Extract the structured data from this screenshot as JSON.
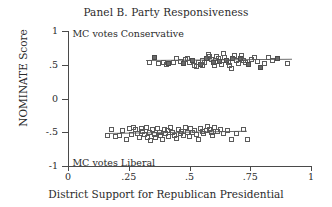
{
  "chart_data": {
    "type": "scatter",
    "title": "Panel B. Party Responsiveness",
    "xlabel": "District Support for Republican Presidential",
    "ylabel": "NOMINATE Score",
    "xlim": [
      0,
      1
    ],
    "ylim": [
      -1,
      1
    ],
    "grid": false,
    "legend": "none",
    "xticks": [
      0,
      0.25,
      0.5,
      0.75,
      1
    ],
    "xtick_labels": [
      "0",
      ".25",
      ".5",
      ".75",
      "1"
    ],
    "yticks": [
      -1,
      -0.5,
      0,
      0.5,
      1
    ],
    "ytick_labels": [
      "-1",
      "-.5",
      "0",
      ".5",
      "1"
    ],
    "annotations": [
      {
        "text": "MC votes Conservative",
        "x": 0.01,
        "y": 0.95,
        "name": "conservative-annotation"
      },
      {
        "text": "MC votes Liberal",
        "x": 0.01,
        "y": -0.95,
        "name": "liberal-annotation"
      }
    ],
    "series": [
      {
        "name": "Republican members",
        "marker": "open-square",
        "fit_line": {
          "x_start": 0.32,
          "x_end": 0.92,
          "y_start": 0.565,
          "y_end": 0.585
        },
        "points": [
          {
            "x": 0.33,
            "y": 0.545
          },
          {
            "x": 0.352,
            "y": 0.618
          },
          {
            "x": 0.368,
            "y": 0.53
          },
          {
            "x": 0.388,
            "y": 0.545
          },
          {
            "x": 0.4,
            "y": 0.52
          },
          {
            "x": 0.412,
            "y": 0.538
          },
          {
            "x": 0.43,
            "y": 0.548
          },
          {
            "x": 0.445,
            "y": 0.6
          },
          {
            "x": 0.458,
            "y": 0.56
          },
          {
            "x": 0.47,
            "y": 0.535
          },
          {
            "x": 0.478,
            "y": 0.592
          },
          {
            "x": 0.49,
            "y": 0.61
          },
          {
            "x": 0.498,
            "y": 0.548
          },
          {
            "x": 0.51,
            "y": 0.57
          },
          {
            "x": 0.518,
            "y": 0.502
          },
          {
            "x": 0.525,
            "y": 0.488
          },
          {
            "x": 0.532,
            "y": 0.54
          },
          {
            "x": 0.54,
            "y": 0.52
          },
          {
            "x": 0.548,
            "y": 0.575
          },
          {
            "x": 0.552,
            "y": 0.498
          },
          {
            "x": 0.56,
            "y": 0.545
          },
          {
            "x": 0.568,
            "y": 0.612
          },
          {
            "x": 0.575,
            "y": 0.66
          },
          {
            "x": 0.58,
            "y": 0.63
          },
          {
            "x": 0.588,
            "y": 0.585
          },
          {
            "x": 0.595,
            "y": 0.552
          },
          {
            "x": 0.6,
            "y": 0.508
          },
          {
            "x": 0.608,
            "y": 0.64
          },
          {
            "x": 0.615,
            "y": 0.6
          },
          {
            "x": 0.62,
            "y": 0.558
          },
          {
            "x": 0.628,
            "y": 0.522
          },
          {
            "x": 0.635,
            "y": 0.672
          },
          {
            "x": 0.64,
            "y": 0.618
          },
          {
            "x": 0.648,
            "y": 0.58
          },
          {
            "x": 0.655,
            "y": 0.548
          },
          {
            "x": 0.66,
            "y": 0.505
          },
          {
            "x": 0.668,
            "y": 0.462
          },
          {
            "x": 0.675,
            "y": 0.6
          },
          {
            "x": 0.682,
            "y": 0.648
          },
          {
            "x": 0.69,
            "y": 0.572
          },
          {
            "x": 0.698,
            "y": 0.538
          },
          {
            "x": 0.705,
            "y": 0.608
          },
          {
            "x": 0.712,
            "y": 0.655
          },
          {
            "x": 0.72,
            "y": 0.582
          },
          {
            "x": 0.728,
            "y": 0.545
          },
          {
            "x": 0.74,
            "y": 0.512
          },
          {
            "x": 0.752,
            "y": 0.595
          },
          {
            "x": 0.765,
            "y": 0.625
          },
          {
            "x": 0.778,
            "y": 0.56
          },
          {
            "x": 0.79,
            "y": 0.472
          },
          {
            "x": 0.805,
            "y": 0.53
          },
          {
            "x": 0.82,
            "y": 0.618
          },
          {
            "x": 0.838,
            "y": 0.572
          },
          {
            "x": 0.858,
            "y": 0.602
          },
          {
            "x": 0.9,
            "y": 0.528
          }
        ]
      },
      {
        "name": "Democratic members",
        "marker": "open-square",
        "fit_line": {
          "x_start": 0.152,
          "x_end": 0.735,
          "y_start": -0.515,
          "y_end": -0.48
        },
        "points": [
          {
            "x": 0.158,
            "y": -0.538
          },
          {
            "x": 0.175,
            "y": -0.448
          },
          {
            "x": 0.19,
            "y": -0.545
          },
          {
            "x": 0.208,
            "y": -0.54
          },
          {
            "x": 0.222,
            "y": -0.462
          },
          {
            "x": 0.238,
            "y": -0.598
          },
          {
            "x": 0.248,
            "y": -0.432
          },
          {
            "x": 0.258,
            "y": -0.528
          },
          {
            "x": 0.268,
            "y": -0.418
          },
          {
            "x": 0.275,
            "y": -0.45
          },
          {
            "x": 0.282,
            "y": -0.5
          },
          {
            "x": 0.29,
            "y": -0.572
          },
          {
            "x": 0.298,
            "y": -0.438
          },
          {
            "x": 0.305,
            "y": -0.478
          },
          {
            "x": 0.312,
            "y": -0.525
          },
          {
            "x": 0.318,
            "y": -0.412
          },
          {
            "x": 0.325,
            "y": -0.558
          },
          {
            "x": 0.332,
            "y": -0.492
          },
          {
            "x": 0.338,
            "y": -0.608
          },
          {
            "x": 0.345,
            "y": -0.452
          },
          {
            "x": 0.352,
            "y": -0.52
          },
          {
            "x": 0.358,
            "y": -0.565
          },
          {
            "x": 0.365,
            "y": -0.425
          },
          {
            "x": 0.372,
            "y": -0.488
          },
          {
            "x": 0.378,
            "y": -0.542
          },
          {
            "x": 0.385,
            "y": -0.598
          },
          {
            "x": 0.392,
            "y": -0.44
          },
          {
            "x": 0.398,
            "y": -0.508
          },
          {
            "x": 0.405,
            "y": -0.468
          },
          {
            "x": 0.412,
            "y": -0.552
          },
          {
            "x": 0.42,
            "y": -0.415
          },
          {
            "x": 0.428,
            "y": -0.495
          },
          {
            "x": 0.435,
            "y": -0.535
          },
          {
            "x": 0.442,
            "y": -0.58
          },
          {
            "x": 0.45,
            "y": -0.445
          },
          {
            "x": 0.458,
            "y": -0.505
          },
          {
            "x": 0.465,
            "y": -0.472
          },
          {
            "x": 0.472,
            "y": -0.53
          },
          {
            "x": 0.48,
            "y": -0.42
          },
          {
            "x": 0.488,
            "y": -0.488
          },
          {
            "x": 0.495,
            "y": -0.545
          },
          {
            "x": 0.502,
            "y": -0.435
          },
          {
            "x": 0.51,
            "y": -0.498
          },
          {
            "x": 0.518,
            "y": -0.462
          },
          {
            "x": 0.525,
            "y": -0.522
          },
          {
            "x": 0.532,
            "y": -0.59
          },
          {
            "x": 0.54,
            "y": -0.428
          },
          {
            "x": 0.548,
            "y": -0.482
          },
          {
            "x": 0.556,
            "y": -0.512
          },
          {
            "x": 0.565,
            "y": -0.455
          },
          {
            "x": 0.572,
            "y": -0.4
          },
          {
            "x": 0.578,
            "y": -0.442
          },
          {
            "x": 0.585,
            "y": -0.488
          },
          {
            "x": 0.592,
            "y": -0.532
          },
          {
            "x": 0.6,
            "y": -0.418
          },
          {
            "x": 0.612,
            "y": -0.475
          },
          {
            "x": 0.625,
            "y": -0.445
          },
          {
            "x": 0.638,
            "y": -0.508
          },
          {
            "x": 0.652,
            "y": -0.465
          },
          {
            "x": 0.668,
            "y": -0.595
          },
          {
            "x": 0.688,
            "y": -0.505
          },
          {
            "x": 0.72,
            "y": -0.452
          },
          {
            "x": 0.735,
            "y": -0.598
          }
        ]
      }
    ]
  }
}
